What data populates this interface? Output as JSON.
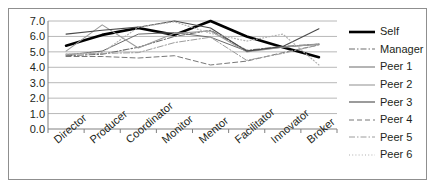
{
  "chart_data": {
    "type": "line",
    "title": "",
    "xlabel": "",
    "ylabel": "",
    "ylim": [
      0.0,
      7.0
    ],
    "ytick_labels": [
      "7.0",
      "6.0",
      "5.0",
      "4.0",
      "3.0",
      "2.0",
      "1.0",
      "0.0"
    ],
    "ytick_values": [
      7.0,
      6.0,
      5.0,
      4.0,
      3.0,
      2.0,
      1.0,
      0.0
    ],
    "grid": true,
    "grid_axis": "y",
    "legend_position": "right",
    "categories": [
      "Director",
      "Producer",
      "Coordinator",
      "Monitor",
      "Mentor",
      "Facilitator",
      "Innovator",
      "Broker"
    ],
    "series": [
      {
        "name": "Self",
        "style": "solid",
        "color": "#000000",
        "width": 2.6,
        "values": [
          5.4,
          6.1,
          6.55,
          6.1,
          7.0,
          6.0,
          5.3,
          4.65
        ]
      },
      {
        "name": "Manager",
        "style": "dashdot",
        "color": "#6e6e6e",
        "width": 1.1,
        "values": [
          4.75,
          4.85,
          5.3,
          6.0,
          6.4,
          5.1,
          5.35,
          5.5
        ]
      },
      {
        "name": "Peer 1",
        "style": "solid",
        "color": "#6a6a6a",
        "width": 1.0,
        "values": [
          4.8,
          5.05,
          6.15,
          6.25,
          5.95,
          5.05,
          5.3,
          5.5
        ]
      },
      {
        "name": "Peer 2",
        "style": "solid",
        "color": "#9a9a9a",
        "width": 1.1,
        "values": [
          5.05,
          6.75,
          5.25,
          6.2,
          6.35,
          5.0,
          5.3,
          5.5
        ]
      },
      {
        "name": "Peer 3",
        "style": "solid",
        "color": "#4a4a4a",
        "width": 1.1,
        "values": [
          6.15,
          6.4,
          6.6,
          7.0,
          6.55,
          5.05,
          5.35,
          6.5
        ]
      },
      {
        "name": "Peer 4",
        "style": "dashed",
        "color": "#777777",
        "width": 1.0,
        "values": [
          4.7,
          4.7,
          4.6,
          4.75,
          4.15,
          4.4,
          4.95,
          5.45
        ]
      },
      {
        "name": "Peer 5",
        "style": "dashdot",
        "color": "#9c9c9c",
        "width": 1.0,
        "values": [
          4.85,
          4.9,
          4.95,
          5.6,
          5.95,
          4.45,
          4.9,
          5.45
        ]
      },
      {
        "name": "Peer 6",
        "style": "dotted",
        "color": "#b0b0b0",
        "width": 1.2,
        "values": [
          4.85,
          4.95,
          6.6,
          6.95,
          6.2,
          5.7,
          6.15,
          4.15
        ]
      }
    ]
  },
  "legend": {
    "entries": [
      {
        "label": "Self"
      },
      {
        "label": "Manager"
      },
      {
        "label": "Peer 1"
      },
      {
        "label": "Peer 2"
      },
      {
        "label": "Peer 3"
      },
      {
        "label": "Peer 4"
      },
      {
        "label": "Peer 5"
      },
      {
        "label": "Peer 6"
      }
    ]
  },
  "colors": {
    "frame_border": "#8f8f8f",
    "gridline": "#b8b8b8",
    "axis": "#808080",
    "text": "#231f20",
    "background": "#ffffff"
  }
}
